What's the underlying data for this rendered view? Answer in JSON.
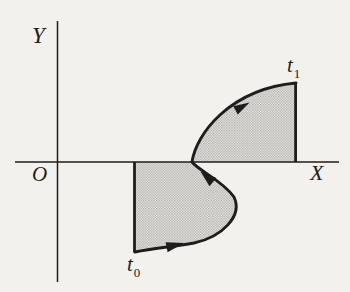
{
  "figure": {
    "colors": {
      "paper": "#f3f1ec",
      "ink": "#1e1d1b",
      "halftone_dot": "#a8a7a4",
      "halftone_base": "#edece8"
    }
  },
  "axes": {
    "x_label": "X",
    "y_label": "Y",
    "origin_label": "O"
  },
  "curve": {
    "start_label": {
      "base": "t",
      "sub": "0"
    },
    "end_label": {
      "base": "t",
      "sub": "1"
    },
    "direction_arrow_count": 3
  }
}
